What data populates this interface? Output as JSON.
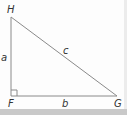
{
  "diagram": {
    "type": "right-triangle",
    "vertices": [
      {
        "name": "H",
        "x": 11,
        "y": 17
      },
      {
        "name": "F",
        "x": 11,
        "y": 96
      },
      {
        "name": "G",
        "x": 117,
        "y": 96
      }
    ],
    "vertex_labels": {
      "H": "H",
      "F": "F",
      "G": "G"
    },
    "side_labels": {
      "a": "a",
      "b": "b",
      "c": "c"
    },
    "right_angle_at": "F",
    "colors": {
      "line": "#8a8a8a",
      "label": "#333333",
      "strip": "#c9c9c9"
    }
  }
}
